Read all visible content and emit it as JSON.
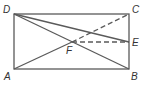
{
  "diagram": {
    "type": "geometry-figure",
    "shape": "rectangle",
    "colors": {
      "line": "#5a5a5a",
      "label": "#333333",
      "background": "#ffffff"
    },
    "points": {
      "A": {
        "label": "A",
        "x": 14,
        "y": 69
      },
      "B": {
        "label": "B",
        "x": 129,
        "y": 69
      },
      "C": {
        "label": "C",
        "x": 129,
        "y": 14
      },
      "D": {
        "label": "D",
        "x": 14,
        "y": 14
      },
      "E": {
        "label": "E",
        "x": 129,
        "y": 42
      },
      "F": {
        "label": "F",
        "x": 72,
        "y": 42
      }
    },
    "segments": [
      {
        "from": "A",
        "to": "B",
        "style": "solid"
      },
      {
        "from": "B",
        "to": "C",
        "style": "solid"
      },
      {
        "from": "C",
        "to": "D",
        "style": "solid"
      },
      {
        "from": "D",
        "to": "A",
        "style": "solid"
      },
      {
        "from": "D",
        "to": "B",
        "style": "solid"
      },
      {
        "from": "D",
        "to": "E",
        "style": "solid"
      },
      {
        "from": "A",
        "to": "F",
        "style": "solid"
      },
      {
        "from": "F",
        "to": "C",
        "style": "dashed"
      },
      {
        "from": "F",
        "to": "E",
        "style": "dashed"
      }
    ]
  }
}
